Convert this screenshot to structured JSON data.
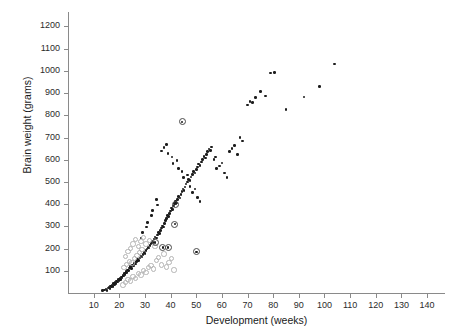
{
  "chart_data": {
    "type": "scatter",
    "title": "",
    "xlabel": "Development (weeks)",
    "ylabel": "Brain weight (grams)",
    "xlim": [
      0,
      147
    ],
    "ylim": [
      0,
      1265
    ],
    "grid": false,
    "legend": "none",
    "x_ticks": [
      10,
      20,
      30,
      40,
      50,
      60,
      70,
      80,
      90,
      100,
      110,
      120,
      130,
      140
    ],
    "y_ticks": [
      100,
      200,
      300,
      400,
      500,
      600,
      700,
      800,
      900,
      1000,
      1100,
      1200
    ],
    "series": [
      {
        "name": "filled-dot",
        "marker": "filled-circle",
        "color": "#1c1c1c",
        "points": [
          [
            13.5,
            10
          ],
          [
            14.2,
            14
          ],
          [
            14.8,
            18
          ],
          [
            15.2,
            12
          ],
          [
            15.6,
            22
          ],
          [
            16.0,
            26
          ],
          [
            16.3,
            20
          ],
          [
            16.6,
            32
          ],
          [
            16.9,
            28
          ],
          [
            17.2,
            36
          ],
          [
            17.5,
            30
          ],
          [
            17.8,
            42
          ],
          [
            18.1,
            38
          ],
          [
            18.4,
            48
          ],
          [
            18.7,
            44
          ],
          [
            19.0,
            54
          ],
          [
            19.3,
            50
          ],
          [
            19.6,
            60
          ],
          [
            19.9,
            56
          ],
          [
            20.2,
            66
          ],
          [
            20.5,
            62
          ],
          [
            20.8,
            72
          ],
          [
            21.1,
            68
          ],
          [
            21.4,
            80
          ],
          [
            21.7,
            76
          ],
          [
            22.0,
            88
          ],
          [
            22.3,
            84
          ],
          [
            22.6,
            96
          ],
          [
            22.9,
            92
          ],
          [
            23.2,
            104
          ],
          [
            23.6,
            100
          ],
          [
            24.0,
            112
          ],
          [
            24.4,
            118
          ],
          [
            24.8,
            110
          ],
          [
            25.2,
            126
          ],
          [
            25.6,
            122
          ],
          [
            26.0,
            134
          ],
          [
            26.4,
            130
          ],
          [
            26.8,
            142
          ],
          [
            27.2,
            150
          ],
          [
            27.6,
            146
          ],
          [
            28.0,
            158
          ],
          [
            28.4,
            166
          ],
          [
            28.8,
            162
          ],
          [
            29.2,
            174
          ],
          [
            29.6,
            182
          ],
          [
            30.0,
            178
          ],
          [
            30.4,
            190
          ],
          [
            30.8,
            198
          ],
          [
            31.2,
            206
          ],
          [
            31.6,
            202
          ],
          [
            32.0,
            214
          ],
          [
            32.4,
            222
          ],
          [
            32.8,
            232
          ],
          [
            33.2,
            228
          ],
          [
            33.6,
            244
          ],
          [
            34.0,
            252
          ],
          [
            34.4,
            248
          ],
          [
            34.8,
            262
          ],
          [
            35.2,
            272
          ],
          [
            35.6,
            268
          ],
          [
            36.0,
            282
          ],
          [
            36.4,
            292
          ],
          [
            36.8,
            302
          ],
          [
            37.2,
            298
          ],
          [
            37.6,
            314
          ],
          [
            38.0,
            326
          ],
          [
            38.4,
            336
          ],
          [
            38.8,
            348
          ],
          [
            39.2,
            344
          ],
          [
            39.6,
            358
          ],
          [
            40.0,
            370
          ],
          [
            40.4,
            382
          ],
          [
            40.8,
            376
          ],
          [
            41.2,
            392
          ],
          [
            41.6,
            402
          ],
          [
            42.0,
            412
          ],
          [
            42.4,
            406
          ],
          [
            42.8,
            422
          ],
          [
            43.2,
            434
          ],
          [
            43.6,
            428
          ],
          [
            44.0,
            444
          ],
          [
            44.4,
            456
          ],
          [
            44.8,
            468
          ],
          [
            45.2,
            462
          ],
          [
            45.6,
            478
          ],
          [
            46.0,
            490
          ],
          [
            46.5,
            500
          ],
          [
            47.0,
            512
          ],
          [
            47.5,
            506
          ],
          [
            48.0,
            522
          ],
          [
            48.5,
            534
          ],
          [
            49.0,
            546
          ],
          [
            49.5,
            540
          ],
          [
            50.0,
            556
          ],
          [
            50.5,
            568
          ],
          [
            51.0,
            580
          ],
          [
            51.5,
            574
          ],
          [
            52.0,
            590
          ],
          [
            52.5,
            602
          ],
          [
            53.0,
            614
          ],
          [
            53.5,
            608
          ],
          [
            54.0,
            624
          ],
          [
            54.5,
            636
          ],
          [
            55.0,
            648
          ],
          [
            55.5,
            642
          ],
          [
            56.0,
            658
          ],
          [
            57.0,
            600
          ],
          [
            57.5,
            612
          ],
          [
            58.0,
            560
          ],
          [
            59.0,
            572
          ],
          [
            60.0,
            586
          ],
          [
            61.0,
            540
          ],
          [
            62.0,
            520
          ],
          [
            63.0,
            636
          ],
          [
            64.0,
            650
          ],
          [
            65.0,
            664
          ],
          [
            66.0,
            624
          ],
          [
            67.0,
            700
          ],
          [
            68.0,
            684
          ],
          [
            70.0,
            846
          ],
          [
            71.0,
            862
          ],
          [
            72.0,
            858
          ],
          [
            73.0,
            880
          ],
          [
            75.0,
            906
          ],
          [
            77.0,
            886
          ],
          [
            79.0,
            990
          ],
          [
            80.5,
            992
          ],
          [
            85.0,
            826
          ],
          [
            92.0,
            882
          ],
          [
            98.0,
            930
          ],
          [
            104.0,
            1030
          ],
          [
            36.5,
            640
          ],
          [
            37.5,
            656
          ],
          [
            38.5,
            668
          ],
          [
            39.0,
            628
          ],
          [
            40.5,
            612
          ],
          [
            41.0,
            584
          ],
          [
            42.5,
            596
          ],
          [
            43.0,
            560
          ],
          [
            44.5,
            548
          ],
          [
            45.0,
            520
          ],
          [
            46.5,
            532
          ],
          [
            47.5,
            480
          ],
          [
            48.5,
            452
          ],
          [
            49.5,
            468
          ],
          [
            50.5,
            430
          ],
          [
            51.5,
            412
          ],
          [
            34.5,
            420
          ],
          [
            35.0,
            396
          ],
          [
            33.0,
            372
          ],
          [
            32.5,
            348
          ],
          [
            31.0,
            318
          ],
          [
            30.5,
            298
          ],
          [
            29.0,
            272
          ],
          [
            28.5,
            248
          ]
        ]
      },
      {
        "name": "open-circle",
        "marker": "open-circle",
        "color": "#b4b4b4",
        "points": [
          [
            21.0,
            40
          ],
          [
            22.0,
            52
          ],
          [
            23.0,
            64
          ],
          [
            24.0,
            58
          ],
          [
            25.0,
            78
          ],
          [
            26.0,
            70
          ],
          [
            27.0,
            92
          ],
          [
            28.0,
            86
          ],
          [
            29.0,
            106
          ],
          [
            30.0,
            98
          ],
          [
            21.5,
            120
          ],
          [
            22.5,
            132
          ],
          [
            23.5,
            146
          ],
          [
            24.5,
            140
          ],
          [
            25.5,
            160
          ],
          [
            26.5,
            172
          ],
          [
            27.5,
            186
          ],
          [
            28.5,
            200
          ],
          [
            31.0,
            118
          ],
          [
            32.0,
            128
          ],
          [
            33.0,
            112
          ],
          [
            34.0,
            150
          ],
          [
            35.0,
            164
          ],
          [
            36.0,
            130
          ],
          [
            37.0,
            180
          ],
          [
            38.0,
            122
          ],
          [
            39.0,
            142
          ],
          [
            40.0,
            160
          ],
          [
            41.0,
            108
          ],
          [
            30.0,
            226
          ],
          [
            31.5,
            240
          ],
          [
            33.5,
            214
          ],
          [
            24.0,
            206
          ],
          [
            25.0,
            226
          ],
          [
            26.0,
            246
          ],
          [
            27.0,
            214
          ],
          [
            28.0,
            236
          ],
          [
            29.0,
            254
          ],
          [
            22.0,
            168
          ],
          [
            23.0,
            190
          ]
        ]
      },
      {
        "name": "target-marker",
        "marker": "circled-dot",
        "color": "#4a4a4a",
        "points": [
          [
            34.0,
            228
          ],
          [
            37.0,
            206
          ],
          [
            39.0,
            206
          ],
          [
            42.0,
            400
          ],
          [
            41.5,
            310
          ],
          [
            44.5,
            770
          ],
          [
            50.0,
            186
          ]
        ]
      }
    ]
  }
}
